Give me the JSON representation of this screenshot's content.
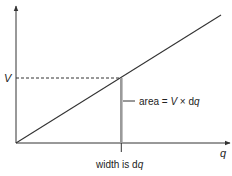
{
  "diagram": {
    "axes": {
      "x_label": "q",
      "y_label": "V"
    },
    "annotations": {
      "area_prefix": "area = ",
      "area_V": "V",
      "area_times": " × d",
      "area_q": "q",
      "width_prefix": "width is d",
      "width_q": "q"
    },
    "colors": {
      "line": "#333333",
      "strip": "#9a9a9a",
      "text": "#222222"
    }
  }
}
